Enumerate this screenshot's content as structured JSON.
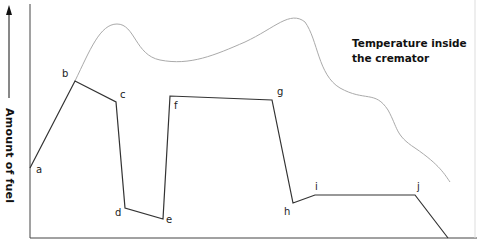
{
  "chart_data": {
    "type": "line",
    "title": "",
    "xlabel": "",
    "ylabel": "Amount of fuel",
    "grid": false,
    "legend_position": "top-right (inline annotation)",
    "series": [
      {
        "name": "Amount of fuel",
        "color": "#333333",
        "points": [
          {
            "label": "a",
            "x": 30,
            "y": 168
          },
          {
            "label": "b",
            "x": 75,
            "y": 81
          },
          {
            "label": "c",
            "x": 116,
            "y": 102
          },
          {
            "label": "d",
            "x": 125,
            "y": 208
          },
          {
            "label": "e",
            "x": 163,
            "y": 219
          },
          {
            "label": "f",
            "x": 170,
            "y": 96
          },
          {
            "label": "g",
            "x": 272,
            "y": 100
          },
          {
            "label": "h",
            "x": 293,
            "y": 203
          },
          {
            "label": "i",
            "x": 315,
            "y": 195
          },
          {
            "label": "j",
            "x": 415,
            "y": 195
          },
          {
            "label": "",
            "x": 448,
            "y": 238
          }
        ]
      },
      {
        "name": "Temperature inside the cremator",
        "color": "#aaaaaa",
        "path_points": [
          [
            75,
            81
          ],
          [
            117,
            24
          ],
          [
            175,
            61
          ],
          [
            240,
            45
          ],
          [
            305,
            19
          ],
          [
            330,
            80
          ],
          [
            370,
            98
          ],
          [
            410,
            130
          ],
          [
            450,
            182
          ]
        ]
      }
    ],
    "annotations": [
      "Temperature inside the cremator"
    ],
    "point_labels": [
      "a",
      "b",
      "c",
      "d",
      "e",
      "f",
      "g",
      "h",
      "i",
      "j"
    ]
  },
  "labels": {
    "y_axis": "Amount of fuel",
    "legend_line1": "Temperature inside",
    "legend_line2": "the cremator",
    "a": "a",
    "b": "b",
    "c": "c",
    "d": "d",
    "e": "e",
    "f": "f",
    "g": "g",
    "h": "h",
    "i": "i",
    "j": "j"
  }
}
